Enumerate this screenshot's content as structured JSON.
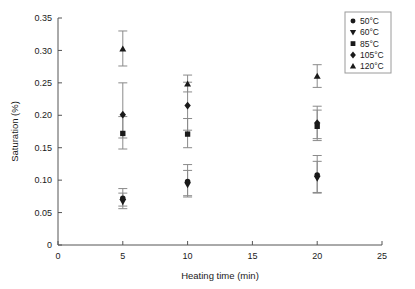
{
  "chart_data": {
    "type": "scatter",
    "title": "",
    "xlabel": "Heating time (min)",
    "ylabel": "Saturation (%)",
    "xlim": [
      0,
      25
    ],
    "ylim": [
      0,
      0.35
    ],
    "xticks": [
      "0",
      "5",
      "10",
      "15",
      "20",
      "25"
    ],
    "xtick_values": [
      0,
      5,
      10,
      15,
      20,
      25
    ],
    "yticks": [
      "0",
      "0.05",
      "0.10",
      "0.15",
      "0.20",
      "0.25",
      "0.30",
      "0.35"
    ],
    "ytick_values": [
      0,
      0.05,
      0.1,
      0.15,
      0.2,
      0.25,
      0.3,
      0.35
    ],
    "grid": false,
    "legend_position": "top-right",
    "x": [
      5,
      10,
      20
    ],
    "series": [
      {
        "name": "50°C",
        "marker": "circle",
        "values": [
          0.072,
          0.098,
          0.108
        ],
        "err_low": [
          0.012,
          0.022,
          0.027
        ],
        "err_high": [
          0.015,
          0.026,
          0.03
        ]
      },
      {
        "name": "60°C",
        "marker": "triangle-down",
        "values": [
          0.067,
          0.093,
          0.103
        ],
        "err_low": [
          0.011,
          0.019,
          0.023
        ],
        "err_high": [
          0.013,
          0.022,
          0.026
        ]
      },
      {
        "name": "85°C",
        "marker": "square",
        "values": [
          0.172,
          0.171,
          0.183
        ],
        "err_low": [
          0.024,
          0.021,
          0.022
        ],
        "err_high": [
          0.026,
          0.024,
          0.025
        ]
      },
      {
        "name": "105°C",
        "marker": "diamond",
        "values": [
          0.201,
          0.215,
          0.188
        ],
        "err_low": [
          0.036,
          0.038,
          0.024
        ],
        "err_high": [
          0.049,
          0.036,
          0.026
        ]
      },
      {
        "name": "120°C",
        "marker": "triangle-up",
        "values": [
          0.302,
          0.248,
          0.26
        ],
        "err_low": [
          0.026,
          0.012,
          0.017
        ],
        "err_high": [
          0.028,
          0.014,
          0.018
        ]
      }
    ],
    "legend_entries": [
      {
        "label": "50°C",
        "marker": "circle"
      },
      {
        "label": "60°C",
        "marker": "triangle-down"
      },
      {
        "label": "85°C",
        "marker": "square"
      },
      {
        "label": "105°C",
        "marker": "diamond"
      },
      {
        "label": "120°C",
        "marker": "triangle-up"
      }
    ],
    "colors": {
      "marker": "#1a1a1a",
      "error_bar": "#8a8a8a",
      "axis": "#555555",
      "background": "#ffffff"
    }
  }
}
